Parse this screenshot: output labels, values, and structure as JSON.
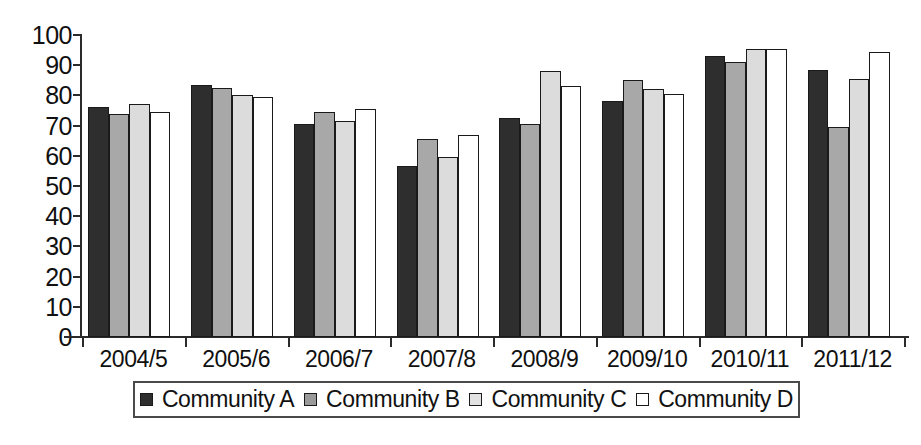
{
  "chart_data": {
    "type": "bar",
    "title": "",
    "subtitle": "",
    "xlabel": "",
    "ylabel": "",
    "ylim": [
      0,
      100
    ],
    "ytick_step": 10,
    "yticks": [
      "100",
      "90",
      "80",
      "70",
      "60",
      "50",
      "40",
      "30",
      "20",
      "10",
      "0"
    ],
    "grid": false,
    "legend_position": "bottom",
    "categories": [
      "2004/5",
      "2005/6",
      "2006/7",
      "2007/8",
      "2008/9",
      "2009/10",
      "2010/11",
      "2011/12"
    ],
    "series": [
      {
        "name": "Community A",
        "color": "#2e2e2e",
        "values": [
          76,
          83.5,
          70.5,
          56.5,
          72.5,
          78,
          93,
          88.5
        ]
      },
      {
        "name": "Community B",
        "color": "#a8a8a8",
        "values": [
          74,
          82.5,
          74.5,
          65.5,
          70.5,
          85,
          91,
          69.5
        ]
      },
      {
        "name": "Community C",
        "color": "#dcdcdc",
        "values": [
          77,
          80,
          71.5,
          59.5,
          88,
          82,
          95.5,
          85.5
        ]
      },
      {
        "name": "Community D",
        "color": "#ffffff",
        "values": [
          74.5,
          79.5,
          75.5,
          67,
          83,
          80.5,
          95.5,
          94.5
        ]
      }
    ]
  },
  "legend": {
    "items": [
      {
        "label": "Community A"
      },
      {
        "label": "Community B"
      },
      {
        "label": "Community C"
      },
      {
        "label": "Community D"
      }
    ]
  }
}
